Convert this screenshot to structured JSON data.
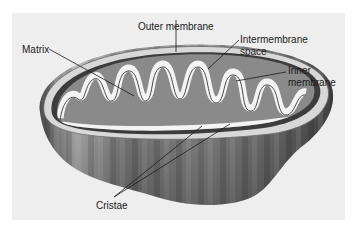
{
  "diagram": {
    "labels": {
      "outer_membrane": "Outer membrane",
      "matrix": "Matrix",
      "intermembrane_space_line1": "Intermembrane",
      "intermembrane_space_line2": "space",
      "inner_membrane_line1": "Inner",
      "inner_membrane_line2": "membrane",
      "cristae": "Cristae"
    },
    "colors": {
      "background_panel": "#eeeeee",
      "page": "#ffffff",
      "outer_shell": "#7a7a7a",
      "intermembrane_dark": "#3c3c3c",
      "inner_fold": "#f4f4f4",
      "matrix_fill": "#8a8a8a",
      "leader_line": "#1a1a1a"
    }
  }
}
